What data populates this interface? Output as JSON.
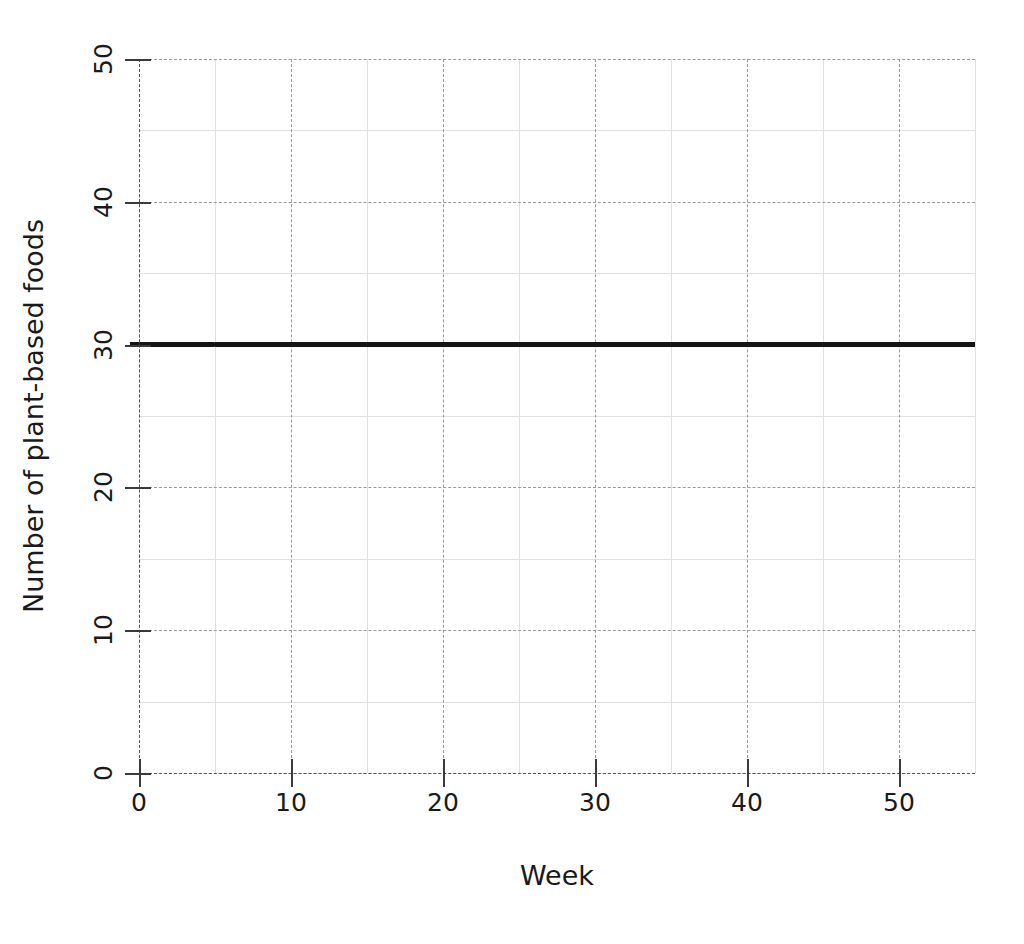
{
  "chart_data": {
    "type": "line",
    "title": "",
    "xlabel": "Week",
    "ylabel": "Number of plant-based foods",
    "xlim": [
      0,
      55
    ],
    "ylim": [
      0,
      50
    ],
    "grid": true,
    "legend": "none",
    "x_major_ticks": [
      0,
      10,
      20,
      30,
      40,
      50
    ],
    "x_minor_gridlines": [
      5,
      15,
      25,
      35,
      45,
      55
    ],
    "y_major_ticks": [
      0,
      10,
      20,
      30,
      40,
      50
    ],
    "y_minor_gridlines": [
      5,
      15,
      25,
      35,
      45
    ],
    "x_tick_labels": [
      "0",
      "10",
      "20",
      "30",
      "40",
      "50"
    ],
    "y_tick_labels": [
      "0",
      "10",
      "20",
      "30",
      "40",
      "50"
    ],
    "series": [
      {
        "name": "plant-based foods",
        "color": "#151515",
        "x": [
          0,
          5,
          10,
          15,
          20,
          25,
          30,
          35,
          40,
          45,
          50,
          55
        ],
        "values": [
          30,
          30,
          30,
          30,
          30,
          30,
          30,
          30,
          30,
          30,
          30,
          30
        ]
      }
    ]
  },
  "axes": {
    "x_title": "Week",
    "y_title": "Number of plant-based foods"
  },
  "colors": {
    "series_line": "#151515",
    "major_grid": "#9a9a9a",
    "minor_grid": "#e0e0e0",
    "axis": "#555555",
    "background": "#ffffff",
    "text": "#1a1a1a"
  }
}
